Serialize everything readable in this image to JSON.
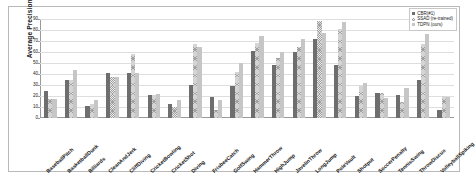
{
  "chart_data": {
    "type": "bar",
    "title": "",
    "xlabel": "",
    "ylabel": "Average Precision(%)",
    "ylim": [
      0,
      90
    ],
    "ytick_labels": [
      "90",
      "80",
      "70",
      "60",
      "50",
      "40",
      "30",
      "20",
      "10",
      "0"
    ],
    "ytick_values": [
      90,
      80,
      70,
      60,
      50,
      40,
      30,
      20,
      10,
      0
    ],
    "grid": true,
    "legend_position": "top-right",
    "categories": [
      "BaseballPitch",
      "BasketballDunk",
      "Billiards",
      "CleanAndJerk",
      "CliffDiving",
      "CricketBowling",
      "CricketShot",
      "Diving",
      "FrisbeeCatch",
      "GolfSwing",
      "HammerThrow",
      "HighJump",
      "JavelinThrow",
      "LongJump",
      "PoleVault",
      "Shotput",
      "SoccerPenalty",
      "TennisSwing",
      "ThrowDiscus",
      "VolleyballSpiking"
    ],
    "series": [
      {
        "name": "CBR(#1)",
        "color": "#6e6e6e",
        "values": [
          25,
          35,
          11,
          41,
          41,
          21,
          13,
          30,
          19,
          29,
          61,
          48,
          60,
          72,
          48,
          20,
          23,
          21,
          35,
          7
        ]
      },
      {
        "name": "SSAD (re-trained)",
        "color": "#a0a0a0",
        "values": [
          17,
          35,
          13,
          37,
          58,
          21,
          10,
          67,
          7,
          42,
          68,
          55,
          65,
          88,
          81,
          29,
          23,
          15,
          67,
          20
        ]
      },
      {
        "name": "TDPN (ours)",
        "color": "#c6c6c6",
        "values": [
          17,
          44,
          16,
          37,
          41,
          22,
          16,
          65,
          16,
          50,
          75,
          60,
          72,
          77,
          87,
          32,
          18,
          27,
          76,
          19
        ]
      }
    ]
  },
  "legend": {
    "entries": [
      {
        "marker": "legend-swatch-cbr",
        "label": "CBR(#1)"
      },
      {
        "marker": "legend-swatch-ssad",
        "label": "SSAD (re-trained)"
      },
      {
        "marker": "legend-swatch-tdpn",
        "label": "TDPN (ours)"
      }
    ]
  }
}
